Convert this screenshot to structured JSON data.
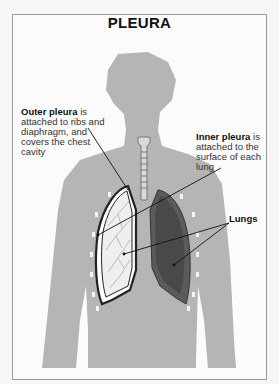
{
  "diagram": {
    "title": "PLEURA",
    "labels": {
      "outer": {
        "term": "Outer pleura",
        "rest": " is attached to ribs and diaphragm, and covers the chest cavity"
      },
      "inner": {
        "term": "Inner pleura",
        "rest": " is attached to the surface of each lung"
      },
      "lungs": "Lungs"
    },
    "colors": {
      "body": "#b5b5b5",
      "lung_right_dark": "#555555",
      "lung_left_light": "#eeeeee",
      "frame_border": "#9a9a9a"
    }
  }
}
